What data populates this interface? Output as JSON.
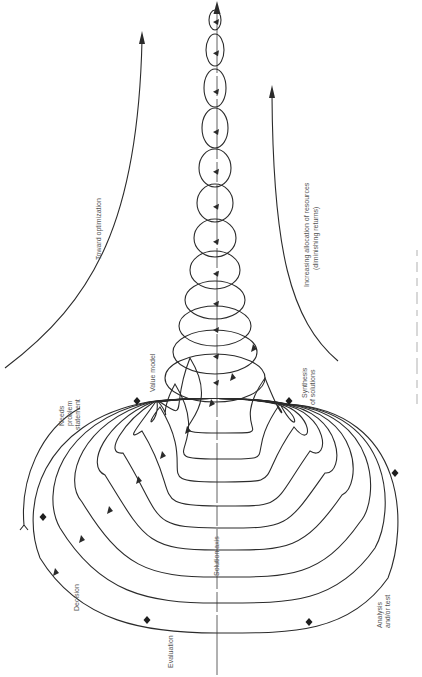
{
  "diagram": {
    "colors": {
      "ink": "#2b2b2b",
      "text": "#555555",
      "background": "#ffffff"
    },
    "axis": {
      "label": "Solution axis",
      "x": 217,
      "y_top": 4,
      "y_bottom": 675
    },
    "labels": {
      "toward_optimization": "Toward optimization",
      "resources_line1": "Increasing allocation of resources",
      "resources_line2": "(diminishing returns)",
      "needs_line1": "Needs",
      "needs_line2": "problem",
      "needs_line3": "statement",
      "value_model": "Value model",
      "synthesis_line1": "Synthesis",
      "synthesis_line2": "of solutions",
      "analysis_line1": "Analysis",
      "analysis_line2": "and/or test",
      "evaluation": "Evaluation",
      "decision": "Decision",
      "solution_axis": "Solution axis"
    },
    "stages": [
      "Needs problem statement",
      "Value model",
      "Synthesis of solutions",
      "Analysis and/or test",
      "Evaluation",
      "Decision"
    ],
    "lower_loops": [
      {
        "left": 20,
        "right": 408,
        "bottom": 633
      },
      {
        "left": 40,
        "right": 395,
        "bottom": 603
      },
      {
        "left": 62,
        "right": 380,
        "bottom": 577
      },
      {
        "left": 85,
        "right": 362,
        "bottom": 550
      },
      {
        "left": 103,
        "right": 345,
        "bottom": 528
      },
      {
        "left": 122,
        "right": 330,
        "bottom": 506
      },
      {
        "left": 140,
        "right": 314,
        "bottom": 482
      },
      {
        "left": 155,
        "right": 300,
        "bottom": 459
      },
      {
        "left": 170,
        "right": 285,
        "bottom": 433
      }
    ],
    "upper_loops": [
      {
        "cy": 378,
        "rx": 50,
        "ry": 24
      },
      {
        "cy": 352,
        "rx": 42,
        "ry": 22
      },
      {
        "cy": 326,
        "rx": 36,
        "ry": 20
      },
      {
        "cy": 300,
        "rx": 30,
        "ry": 19
      },
      {
        "cy": 270,
        "rx": 25,
        "ry": 19
      },
      {
        "cy": 238,
        "rx": 21,
        "ry": 19
      },
      {
        "cy": 203,
        "rx": 18,
        "ry": 19
      },
      {
        "cy": 168,
        "rx": 16,
        "ry": 19
      },
      {
        "cy": 128,
        "rx": 13,
        "ry": 20
      },
      {
        "cy": 88,
        "rx": 11,
        "ry": 19
      },
      {
        "cy": 50,
        "rx": 9,
        "ry": 16
      },
      {
        "cy": 20,
        "rx": 6,
        "ry": 10
      }
    ],
    "stage_markers": [
      {
        "name": "needs",
        "x": 137,
        "y": 401
      },
      {
        "name": "synthesis",
        "x": 289,
        "y": 401
      },
      {
        "name": "analysis",
        "x": 395,
        "y": 473
      },
      {
        "name": "analysis-test",
        "x": 309,
        "y": 622
      },
      {
        "name": "evaluation",
        "x": 147,
        "y": 620
      },
      {
        "name": "decision",
        "x": 43,
        "y": 517
      }
    ]
  }
}
